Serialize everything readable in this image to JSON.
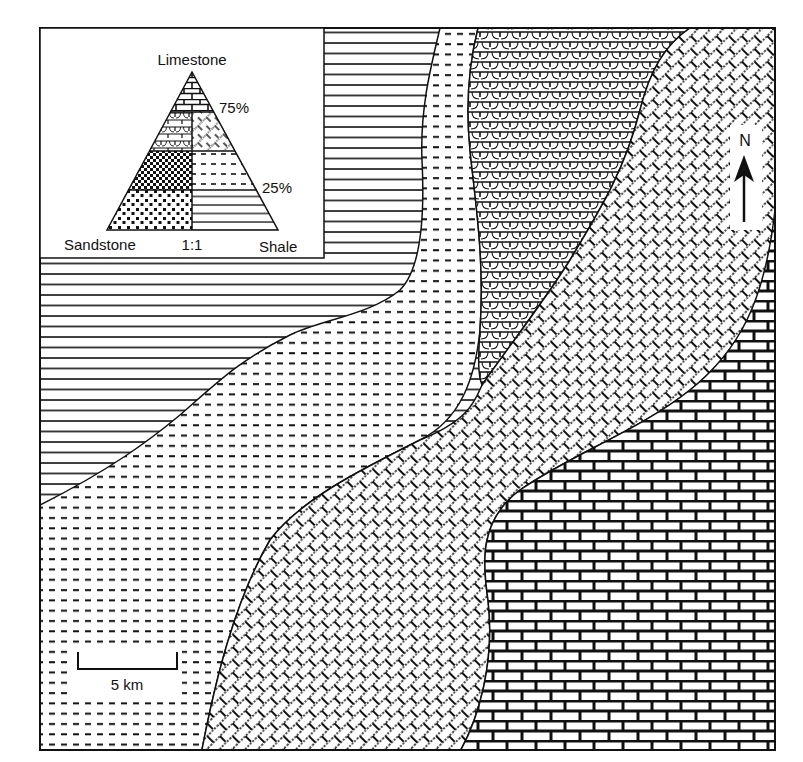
{
  "figure": {
    "type": "lithofacies map",
    "frame": {
      "x": 40,
      "y": 28,
      "width": 735,
      "height": 722
    },
    "colors": {
      "ink": "#111111",
      "paper": "#ffffff"
    }
  },
  "legend": {
    "apex_label": "Limestone",
    "left_label": "Sandstone",
    "right_label": "Shale",
    "midline_label": "1:1",
    "upper_threshold_label": "75%",
    "lower_threshold_label": "25%",
    "zones": [
      {
        "name": "limestone",
        "pattern": "brick",
        "range": "> 75% limestone"
      },
      {
        "name": "sandy-limestone",
        "pattern": "scalloped-limestone",
        "range": "25-75% limestone, sandstone > shale"
      },
      {
        "name": "shaly-limestone",
        "pattern": "diagonal-limestone",
        "range": "25-75% limestone, shale > sandstone"
      },
      {
        "name": "calcareous-sandstone",
        "pattern": "checker",
        "range": "25-75% limestone, sandstone side (lower)"
      },
      {
        "name": "calcareous-shale",
        "pattern": "dashed",
        "range": "25-75% limestone, shale side (lower)"
      },
      {
        "name": "sandstone",
        "pattern": "stipple",
        "range": "< 25% limestone, sandstone > shale"
      },
      {
        "name": "shale",
        "pattern": "horizontal-lines",
        "range": "< 25% limestone, shale > sandstone"
      }
    ]
  },
  "north_arrow": {
    "label": "N"
  },
  "scale_bar": {
    "label": "5 km"
  },
  "map_units": [
    {
      "id": "shale",
      "pattern": "horizontal-lines",
      "position": "northwest"
    },
    {
      "id": "calcareous-shale",
      "pattern": "dashed",
      "position": "west-central to southwest"
    },
    {
      "id": "sandy-limestone",
      "pattern": "scalloped-limestone",
      "position": "north-central"
    },
    {
      "id": "shaly-limestone",
      "pattern": "diagonal-limestone",
      "position": "diagonal belt NE to S"
    },
    {
      "id": "limestone",
      "pattern": "brick",
      "position": "southeast"
    }
  ]
}
